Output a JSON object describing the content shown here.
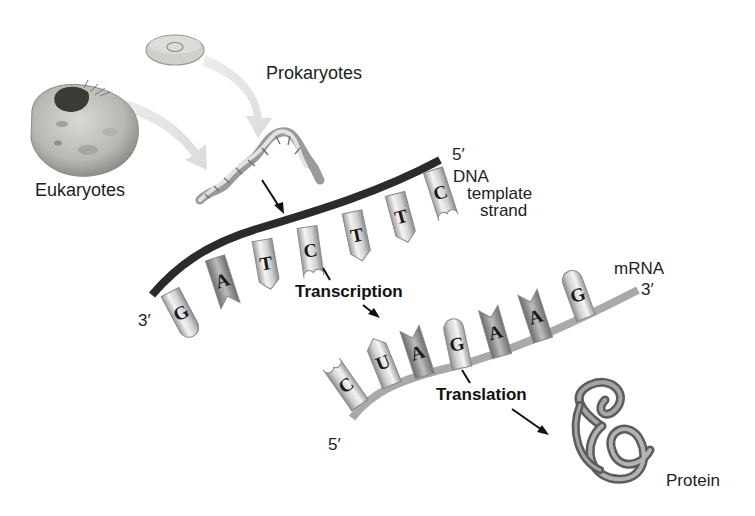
{
  "labels": {
    "prokaryotes": "Prokaryotes",
    "eukaryotes": "Eukaryotes",
    "dna_five_prime": "5′",
    "dna_line1": "DNA",
    "dna_line2": "template",
    "dna_line3": "strand",
    "dna_three_prime": "3′",
    "transcription": "Transcription",
    "mrna": "mRNA",
    "mrna_three_prime": "3′",
    "mrna_five_prime": "5′",
    "translation": "Translation",
    "protein": "Protein"
  },
  "dna_template": {
    "direction": "3′ to 5′",
    "bases": [
      "G",
      "A",
      "T",
      "C",
      "T",
      "T",
      "C"
    ]
  },
  "mrna": {
    "direction": "5′ to 3′",
    "bases": [
      "C",
      "U",
      "A",
      "G",
      "A",
      "A",
      "G"
    ]
  },
  "colors": {
    "dna_backbone": "#2b2b2b",
    "mrna_backbone": "#a9a9a9",
    "base_fill": "#e6e6e6",
    "base_stroke": "#8a8a8a",
    "text": "#222222"
  }
}
